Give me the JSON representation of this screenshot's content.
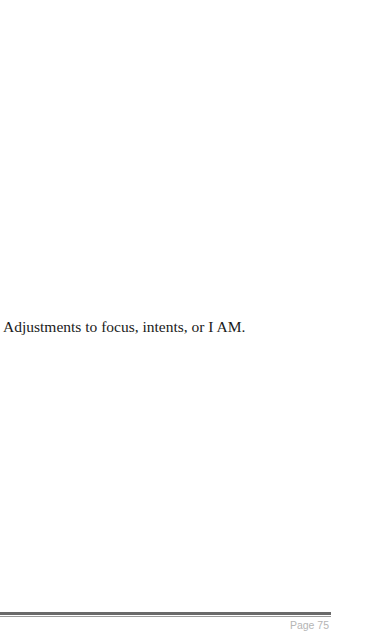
{
  "document": {
    "body_text": "Adjustments to focus, intents, or I AM."
  },
  "footer": {
    "page_label": "Page 75"
  }
}
